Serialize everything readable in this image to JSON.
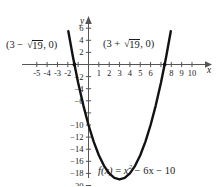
{
  "chart_data": {
    "type": "line",
    "title": "",
    "subtitle": "",
    "xlabel": "x",
    "ylabel": "y",
    "xlim": [
      -6,
      11
    ],
    "ylim": [
      -21,
      8
    ],
    "grid": false,
    "legend_position": "none",
    "function_expression": "f(x) = x² − 6x − 10",
    "equation_parts": {
      "fx": "f",
      "arg": "(x)",
      "equals": "=",
      "term1_base": "x",
      "term1_exp": "2",
      "term2": "− 6x",
      "term3": "− 10"
    },
    "x_ticks": [
      -5,
      -4,
      -3,
      -2,
      -1,
      1,
      2,
      3,
      4,
      5,
      6,
      7,
      8,
      9,
      10
    ],
    "x_tick_labels": [
      "-5",
      "-4",
      "-3",
      "-2",
      "",
      "1",
      "2",
      "3",
      "4",
      "5",
      "6",
      "",
      "8",
      "9",
      "10"
    ],
    "y_ticks": [
      -20,
      -18,
      -16,
      -14,
      -12,
      -10,
      -8,
      -6,
      -4,
      -2,
      2,
      4,
      6
    ],
    "y_tick_labels": [
      "−20",
      "−18",
      "−16",
      "−14",
      "−12",
      "−10",
      "",
      "−6",
      "−4",
      "−2",
      "2",
      "4",
      "6"
    ],
    "vertex": [
      3,
      -19
    ],
    "roots": [
      -1.359,
      7.359
    ],
    "curve_points_x": [
      -1.95,
      -1.5,
      -1.0,
      -0.5,
      0.0,
      0.5,
      1.0,
      1.5,
      2.0,
      2.5,
      3.0,
      3.5,
      4.0,
      4.5,
      5.0,
      5.5,
      6.0,
      6.5,
      7.0,
      7.5,
      7.95
    ],
    "annotations": [
      {
        "name": "left-root",
        "text": "(3 − √19, 0)",
        "parts": {
          "open": "(3 − ",
          "radical": "√",
          "radicand": "19",
          "close": ", 0)"
        },
        "x": -1.359,
        "y": 0
      },
      {
        "name": "right-root",
        "text": "(3 + √19, 0)",
        "parts": {
          "open": "(3 + ",
          "radical": "√",
          "radicand": "19",
          "close": ", 0)"
        },
        "x": 7.359,
        "y": 0
      }
    ],
    "colors": {
      "curve": "#121212",
      "axis": "#555555",
      "text": "#1b1b1b",
      "background": "#ffffff"
    }
  },
  "axes": {
    "x_axis_label": "x",
    "y_axis_label": "y"
  }
}
